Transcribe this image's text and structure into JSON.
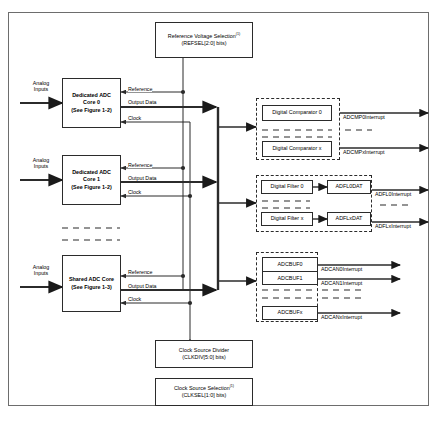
{
  "diagram": {
    "footnote_marker": "(1)"
  },
  "inputs": [
    {
      "name": "analog-inputs-0",
      "line1": "Analog",
      "line2": "Inputs"
    },
    {
      "name": "analog-inputs-1",
      "line1": "Analog",
      "line2": "Inputs"
    },
    {
      "name": "analog-inputs-shared",
      "line1": "Analog",
      "line2": "Inputs"
    }
  ],
  "cores": [
    {
      "line1": "Dedicated ADC",
      "line2": "Core 0",
      "line3": "(See Figure 1-2)"
    },
    {
      "line1": "Dedicated ADC",
      "line2": "Core 1",
      "line3": "(See Figure 1-2)"
    },
    {
      "line1": "Shared ADC Core",
      "line2": "(See Figure 1-3)",
      "line3": ""
    }
  ],
  "signals": {
    "reference": "Reference",
    "output_data": "Output Data",
    "clock": "Clock"
  },
  "reference_block": {
    "line1": "Reference Voltage Selection",
    "line2": "(REFSEL[2:0] bits)"
  },
  "clock_divider_block": {
    "line1": "Clock Source Divider",
    "line2": "(CLKDIV[5:0] bits)"
  },
  "clock_select_block": {
    "line1": "Clock Source Selection",
    "line2": "(CLKSEL[1:0] bits)"
  },
  "comparators": {
    "items": [
      {
        "label": "Digital Comparator 0",
        "interrupt": "ADCMP0Interrupt"
      },
      {
        "label": "Digital Comparator x",
        "interrupt": "ADCMPxInterrupt"
      }
    ]
  },
  "filters": {
    "items": [
      {
        "label": "Digital Filter 0",
        "data": "ADFL0DAT",
        "interrupt": "ADFL0Interrupt"
      },
      {
        "label": "Digital Filter x",
        "data": "ADFLxDAT",
        "interrupt": "ADFLxInterrupt"
      }
    ]
  },
  "buffers": {
    "group_a": [
      "ADCBUF0",
      "ADCBUF1"
    ],
    "group_b": [
      "ADCBUFx"
    ],
    "interrupts": [
      "ADCAN0Interrupt",
      "ADCAN1Interrupt",
      "ADCANxInterrupt"
    ]
  },
  "colors": {
    "line": "#2b2b2b",
    "frame": "#6d6d6d",
    "background": "#ffffff"
  }
}
